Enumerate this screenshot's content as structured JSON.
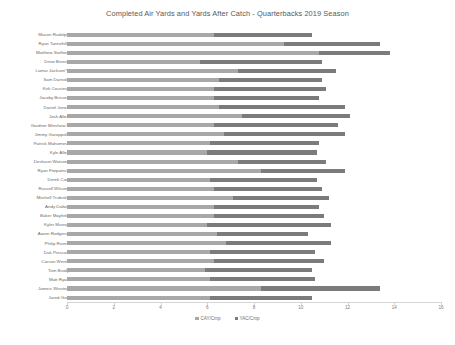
{
  "chart_data": {
    "type": "bar",
    "orientation": "horizontal",
    "stacked": true,
    "title": "Completed Air Yards and Yards After Catch - Quarterbacks 2019 Season",
    "xlabel": "",
    "ylabel": "",
    "xlim": [
      0,
      16
    ],
    "xticks": [
      0,
      2,
      4,
      6,
      8,
      10,
      12,
      14,
      16
    ],
    "grid": false,
    "legend_position": "bottom",
    "colors": {
      "CAY/Cmp": "#a8a8a8",
      "YAC/Cmp": "#7b7b7b"
    },
    "categories": [
      "Mason Rudolph",
      "Ryan Tannehill*",
      "Matthew Stafford",
      "Drew Brees*",
      "Lamar Jackson*^",
      "Sam Darnold",
      "Kirk Cousins*",
      "Jacoby Brissett",
      "Daniel Jones",
      "Josh Allen",
      "Gardner Minshew II",
      "Jimmy Garoppolo",
      "Patrick Mahomes*",
      "Kyle Allen",
      "Deshaun Watson*",
      "Ryan Fitzpatrick",
      "Derek Carr",
      "Russell Wilson*",
      "Mitchell Trubisky",
      "Andy Dalton",
      "Baker Mayfield",
      "Kyler Murray",
      "Aaron Rodgers*",
      "Philip Rivers",
      "Dak Prescott",
      "Carson Wentz",
      "Tom Brady",
      "Matt Ryan",
      "Jameis Winston",
      "Jared Goff"
    ],
    "series": [
      {
        "name": "CAY/Cmp",
        "values": [
          6.3,
          9.3,
          10.8,
          5.7,
          7.3,
          6.5,
          6.3,
          6.3,
          6.5,
          7.5,
          6.3,
          6.7,
          6.1,
          6.0,
          7.3,
          8.3,
          6.1,
          6.3,
          7.1,
          6.3,
          6.3,
          6.0,
          6.4,
          6.8,
          6.1,
          6.3,
          5.9,
          6.1,
          8.3,
          6.1
        ]
      },
      {
        "name": "YAC/Cmp",
        "values": [
          4.2,
          4.1,
          3.0,
          5.2,
          4.2,
          4.4,
          4.8,
          4.5,
          5.4,
          4.6,
          5.3,
          5.2,
          4.7,
          4.7,
          3.8,
          3.6,
          4.6,
          4.6,
          4.1,
          4.5,
          4.7,
          5.3,
          3.9,
          4.5,
          4.5,
          4.7,
          4.6,
          4.5,
          5.1,
          4.4
        ]
      }
    ]
  },
  "legend": [
    {
      "label": "CAY/Cmp",
      "color": "#a8a8a8"
    },
    {
      "label": "YAC/Cmp",
      "color": "#7b7b7b"
    }
  ]
}
